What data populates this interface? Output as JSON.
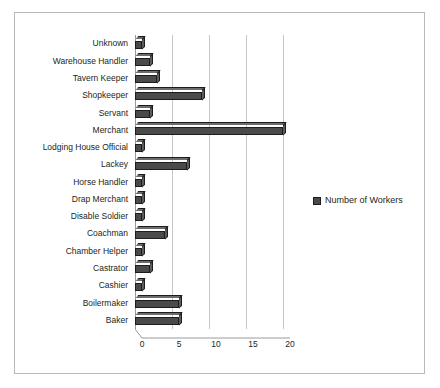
{
  "chart_data": {
    "type": "bar",
    "orientation": "horizontal",
    "title": "",
    "xlabel": "",
    "ylabel": "",
    "xlim": [
      0,
      20
    ],
    "xticks": [
      0,
      5,
      10,
      15,
      20
    ],
    "grid": true,
    "legend_position": "right",
    "legend": [
      "Number of Workers"
    ],
    "series_name": "Number of Workers",
    "series_color": "#4a4a4a",
    "categories": [
      "Unknown",
      "Warehouse Handler",
      "Tavern Keeper",
      "Shopkeeper",
      "Servant",
      "Merchant",
      "Lodging House Official",
      "Lackey",
      "Horse Handler",
      "Drap Merchant",
      "Disable Soldier",
      "Coachman",
      "Chamber Helper",
      "Castrator",
      "Cashier",
      "Boilermaker",
      "Baker"
    ],
    "values": [
      1,
      2,
      3,
      9,
      2,
      20,
      1,
      7,
      1,
      1,
      1,
      4,
      1,
      2,
      1,
      6,
      6
    ]
  }
}
